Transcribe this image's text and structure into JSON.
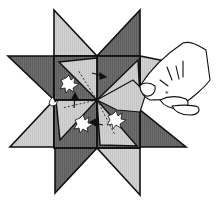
{
  "figure": {
    "description": "Paper folding instruction illustration: eight-pointed woven paper star with a hand pulling a strip",
    "colors": {
      "background": "#ffffff",
      "dark": "#6e6e6e",
      "light": "#cfcfcf",
      "outline": "#111111",
      "hand_fill": "#ffffff"
    },
    "center": [
      97,
      100
    ],
    "central_square": {
      "x1": 54,
      "y1": 56,
      "x2": 140,
      "y2": 148
    },
    "points": [
      {
        "name": "top-left-point",
        "shade": "light",
        "apex": [
          54,
          10
        ]
      },
      {
        "name": "top-right-point",
        "shade": "dark",
        "apex": [
          140,
          10
        ]
      },
      {
        "name": "left-upper-point",
        "shade": "dark",
        "apex": [
          8,
          56
        ]
      },
      {
        "name": "left-lower-point",
        "shade": "light",
        "apex": [
          10,
          147
        ]
      },
      {
        "name": "bottom-left-point",
        "shade": "dark",
        "apex": [
          55,
          193
        ]
      },
      {
        "name": "bottom-right-point",
        "shade": "light",
        "apex": [
          140,
          195
        ]
      },
      {
        "name": "right-lower-point",
        "shade": "dark",
        "apex": [
          186,
          147
        ]
      }
    ],
    "annotations": {
      "arrows": 4,
      "leaf_markers": 4,
      "star_mark": "*"
    }
  }
}
